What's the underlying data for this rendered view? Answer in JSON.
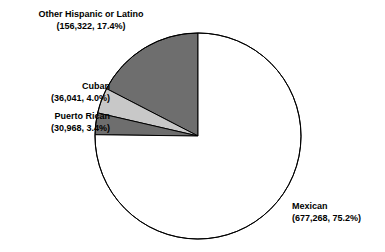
{
  "chart_data": {
    "type": "pie",
    "title": "",
    "legend_position": "callout-labels",
    "total": 900599,
    "categories": [
      "Other Hispanic or Latino",
      "Cuban",
      "Puerto Rican",
      "Mexican"
    ],
    "values": [
      156322,
      36041,
      30968,
      677268
    ],
    "percents": [
      17.4,
      4.0,
      3.4,
      75.2
    ],
    "slices": [
      {
        "name": "Other Hispanic or Latino",
        "value": 156322,
        "value_text": "156,322",
        "percent": 17.4,
        "percent_text": "17.4%",
        "label_line1": "Other Hispanic or Latino",
        "label_line2": "(156,322, 17.4%)",
        "color": "#6e6e6e"
      },
      {
        "name": "Cuban",
        "value": 36041,
        "value_text": "36,041",
        "percent": 4.0,
        "percent_text": "4.0%",
        "label_line1": "Cuban",
        "label_line2": "(36,041, 4.0%)",
        "color": "#c8c8c8"
      },
      {
        "name": "Puerto Rican",
        "value": 30968,
        "value_text": "30,968",
        "percent": 3.4,
        "percent_text": "3.4%",
        "label_line1": "Puerto Rican",
        "label_line2": "(30,968, 3.4%)",
        "color": "#6e6e6e"
      },
      {
        "name": "Mexican",
        "value": 677268,
        "value_text": "677,268",
        "percent": 75.2,
        "percent_text": "75.2%",
        "label_line1": "Mexican",
        "label_line2": "(677,268, 75.2%)",
        "color": "#ffffff"
      }
    ],
    "geometry": {
      "center_x": 198,
      "center_y": 136,
      "radius": 103,
      "start_angle_deg": 0,
      "direction": "counterclockwise"
    },
    "stroke_color": "#000000"
  }
}
